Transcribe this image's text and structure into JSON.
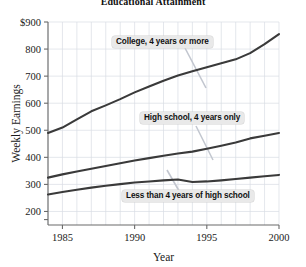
{
  "chart_data": {
    "type": "line",
    "title": "Educational Attainment",
    "xlabel": "Year",
    "ylabel": "Weekly Earnings",
    "xlim": [
      1984,
      2000
    ],
    "ylim": [
      150,
      900
    ],
    "grid": true,
    "legend_position": "inline-annotations",
    "xticks": [
      "1985",
      "1990",
      "1995",
      "2000"
    ],
    "xtick_values": [
      1985,
      1990,
      1995,
      2000
    ],
    "yticks": [
      "$900",
      "800",
      "700",
      "600",
      "500",
      "400",
      "300",
      "200"
    ],
    "ytick_values": [
      900,
      800,
      700,
      600,
      500,
      400,
      300,
      200
    ],
    "x": [
      1984,
      1985,
      1986,
      1987,
      1988,
      1989,
      1990,
      1991,
      1992,
      1993,
      1994,
      1995,
      1996,
      1997,
      1998,
      1999,
      2000
    ],
    "series": [
      {
        "name": "College, 4 years or more",
        "values": [
          490,
          510,
          540,
          570,
          592,
          615,
          640,
          662,
          683,
          702,
          718,
          733,
          748,
          762,
          785,
          818,
          855
        ]
      },
      {
        "name": "High school, 4 years only",
        "values": [
          325,
          337,
          348,
          358,
          368,
          378,
          388,
          397,
          406,
          414,
          421,
          432,
          443,
          455,
          470,
          480,
          490
        ]
      },
      {
        "name": "Less than 4 years of high school",
        "values": [
          263,
          272,
          280,
          288,
          295,
          301,
          307,
          311,
          315,
          318,
          309,
          311,
          315,
          320,
          325,
          330,
          335
        ]
      }
    ]
  },
  "annotations": [
    {
      "label": "College, 4 years or more"
    },
    {
      "label": "High school, 4 years only"
    },
    {
      "label": "Less than 4 years of high school"
    }
  ]
}
